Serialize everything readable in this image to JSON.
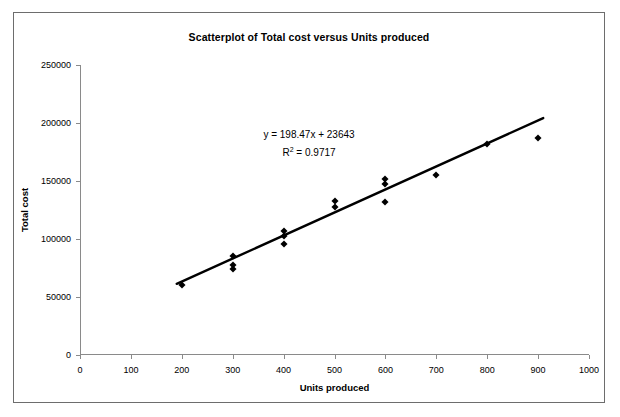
{
  "figure": {
    "title": "Scatterplot of Total cost versus Units produced",
    "annotation_equation": "y = 198.47x + 23643",
    "annotation_r2_prefix": "R",
    "annotation_r2_sup": "2",
    "annotation_r2_value": " = 0.9717",
    "border_color": "#6d6d6d",
    "marker_color": "#000000",
    "trendline_color": "#000000"
  },
  "chart_data": {
    "type": "scatter",
    "title": "Scatterplot of Total cost versus Units produced",
    "xlabel": "Units produced",
    "ylabel": "Total cost",
    "xlim": [
      0,
      1000
    ],
    "ylim": [
      0,
      250000
    ],
    "xticks": [
      0,
      100,
      200,
      300,
      400,
      500,
      600,
      700,
      800,
      900,
      1000
    ],
    "xticklabels": [
      "0",
      "100",
      "200",
      "300",
      "400",
      "500",
      "600",
      "700",
      "800",
      "900",
      "1000"
    ],
    "yticks": [
      0,
      50000,
      100000,
      150000,
      200000,
      250000
    ],
    "yticklabels": [
      "0",
      "50000",
      "100000",
      "150000",
      "200000",
      "250000"
    ],
    "grid": false,
    "legend": null,
    "marker": "diamond",
    "points": [
      {
        "x": 200,
        "y": 60000
      },
      {
        "x": 300,
        "y": 85000
      },
      {
        "x": 300,
        "y": 78000
      },
      {
        "x": 300,
        "y": 74000
      },
      {
        "x": 400,
        "y": 107000
      },
      {
        "x": 400,
        "y": 103000
      },
      {
        "x": 400,
        "y": 96000
      },
      {
        "x": 500,
        "y": 133000
      },
      {
        "x": 500,
        "y": 128000
      },
      {
        "x": 600,
        "y": 152000
      },
      {
        "x": 600,
        "y": 147000
      },
      {
        "x": 600,
        "y": 132000
      },
      {
        "x": 700,
        "y": 155000
      },
      {
        "x": 800,
        "y": 182000
      },
      {
        "x": 900,
        "y": 187000
      }
    ],
    "trendline": {
      "equation": "y = 198.47x + 23643",
      "slope": 198.47,
      "intercept": 23643,
      "r_squared": 0.9717,
      "x_start": 190,
      "x_end": 910
    },
    "annotations": [
      {
        "text": "y = 198.47x + 23643"
      },
      {
        "text": "R2 = 0.9717"
      }
    ]
  }
}
